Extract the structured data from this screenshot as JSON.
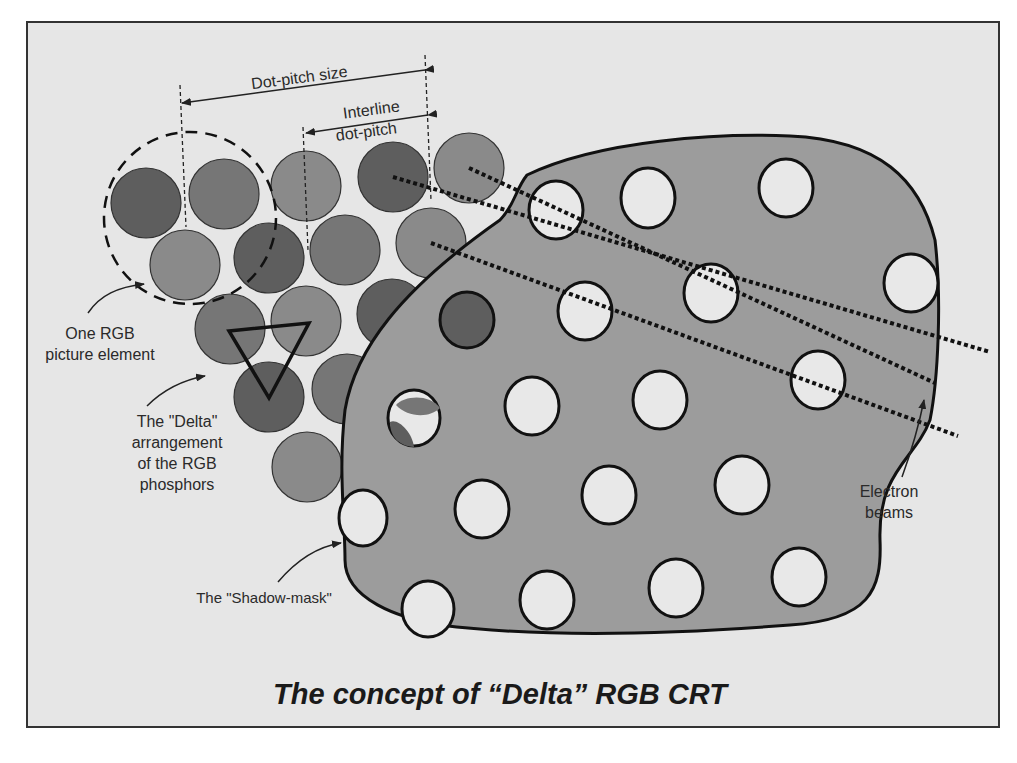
{
  "title": "The concept of “Delta” RGB CRT",
  "colors": {
    "page_background": "#ffffff",
    "panel_background": "#e6e6e6",
    "panel_border": "#333333",
    "phosphor_dark": "#5e5e5e",
    "phosphor_medium": "#767676",
    "phosphor_light": "#8a8a8a",
    "shadow_mask_fill": "#9c9c9c",
    "mask_hole_fill": "#e8e8e8",
    "outline": "#111111"
  },
  "labels": {
    "dot_pitch_size": "Dot-pitch size",
    "interline_dot_pitch": [
      "Interline",
      "dot-pitch"
    ],
    "rgb_picture_element": [
      "One RGB",
      "picture element"
    ],
    "delta_arrangement": [
      "The \"Delta\"",
      "arrangement",
      "of the RGB",
      "phosphors"
    ],
    "shadow_mask": "The \"Shadow-mask\"",
    "electron_beams": [
      "Electron",
      "beams"
    ]
  },
  "components": {
    "phosphor_dots": "RGB phosphor dots in a delta (triangular) arrangement",
    "shadow_mask": "perforated shadow mask plate with circular holes",
    "electron_beams_count": 3,
    "pixel_group_marker": "dashed circle around one RGB picture element",
    "delta_marker": "triangle linking three phosphor dots"
  }
}
